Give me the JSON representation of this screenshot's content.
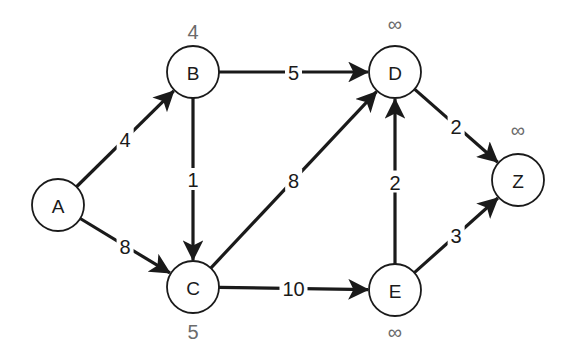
{
  "diagram": {
    "type": "weighted-directed-graph",
    "colors": {
      "stroke": "#1a1a1a",
      "distance_label": "#6b6b6b",
      "background": "#ffffff"
    },
    "nodes": [
      {
        "id": "A",
        "label": "A",
        "x": 58,
        "y": 205,
        "r": 26,
        "distance": ""
      },
      {
        "id": "B",
        "label": "B",
        "x": 193,
        "y": 72,
        "r": 26,
        "distance": "4",
        "dist_dx": 0,
        "dist_dy": -40
      },
      {
        "id": "C",
        "label": "C",
        "x": 193,
        "y": 287,
        "r": 26,
        "distance": "5",
        "dist_dx": 0,
        "dist_dy": 45
      },
      {
        "id": "D",
        "label": "D",
        "x": 395,
        "y": 72,
        "r": 26,
        "distance": "∞",
        "dist_dx": 0,
        "dist_dy": -48
      },
      {
        "id": "E",
        "label": "E",
        "x": 395,
        "y": 290,
        "r": 26,
        "distance": "∞",
        "dist_dx": 0,
        "dist_dy": 42
      },
      {
        "id": "Z",
        "label": "Z",
        "x": 518,
        "y": 180,
        "r": 26,
        "distance": "∞",
        "dist_dx": 0,
        "dist_dy": -50
      }
    ],
    "edges": [
      {
        "from": "A",
        "to": "B",
        "weight": "4",
        "t": 0.5
      },
      {
        "from": "A",
        "to": "C",
        "weight": "8",
        "t": 0.5
      },
      {
        "from": "B",
        "to": "D",
        "weight": "5",
        "t": 0.5
      },
      {
        "from": "B",
        "to": "C",
        "weight": "1",
        "t": 0.5
      },
      {
        "from": "C",
        "to": "D",
        "weight": "8",
        "t": 0.5
      },
      {
        "from": "C",
        "to": "E",
        "weight": "10",
        "t": 0.5
      },
      {
        "from": "E",
        "to": "D",
        "weight": "2",
        "t": 0.5
      },
      {
        "from": "D",
        "to": "Z",
        "weight": "2",
        "t": 0.5
      },
      {
        "from": "E",
        "to": "Z",
        "weight": "3",
        "t": 0.5
      }
    ]
  }
}
